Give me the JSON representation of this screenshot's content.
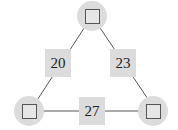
{
  "diagram": {
    "type": "triangle-number-puzzle",
    "nodes": [
      {
        "id": "top",
        "value": ""
      },
      {
        "id": "bottom-left",
        "value": ""
      },
      {
        "id": "bottom-right",
        "value": ""
      }
    ],
    "edges": [
      {
        "id": "left",
        "between": [
          "top",
          "bottom-left"
        ],
        "sum": "20"
      },
      {
        "id": "right",
        "between": [
          "top",
          "bottom-right"
        ],
        "sum": "23"
      },
      {
        "id": "bottom",
        "between": [
          "bottom-left",
          "bottom-right"
        ],
        "sum": "27"
      }
    ],
    "colors": {
      "fill": "#dcdcdc",
      "line": "#555555",
      "text": "#222222"
    }
  }
}
